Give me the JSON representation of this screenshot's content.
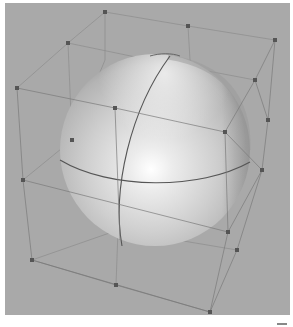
{
  "scene": {
    "description": "3D rendered sphere inside a deformation lattice cage",
    "background_color": "#a9a9a9",
    "sphere": {
      "center": [
        155,
        150
      ],
      "radius_x": 95,
      "radius_y": 96,
      "base_color": "#d6d6d6",
      "highlight_color": "#ffffff",
      "shadow_color": "#8f8f8f",
      "highlight_position": [
        150,
        168
      ]
    },
    "lattice": {
      "line_color": "#7d7d7d",
      "point_color": "#555555",
      "points": [
        [
          105,
          12
        ],
        [
          188,
          26
        ],
        [
          275,
          40
        ],
        [
          17,
          88
        ],
        [
          68,
          43
        ],
        [
          115,
          108
        ],
        [
          255,
          80
        ],
        [
          268,
          120
        ],
        [
          262,
          170
        ],
        [
          225,
          132
        ],
        [
          23,
          180
        ],
        [
          72,
          140
        ],
        [
          32,
          260
        ],
        [
          116,
          285
        ],
        [
          210,
          312
        ],
        [
          228,
          232
        ],
        [
          237,
          250
        ],
        [
          118,
          230
        ]
      ]
    }
  }
}
